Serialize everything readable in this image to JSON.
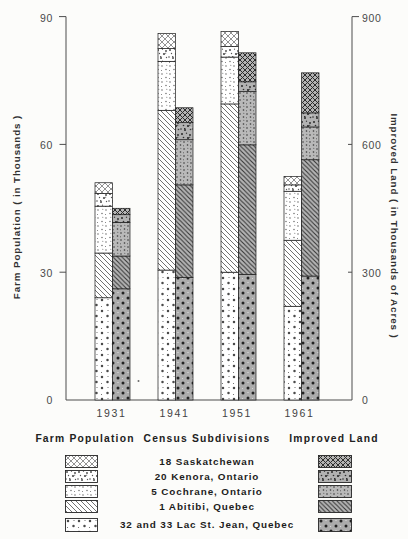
{
  "page": {
    "background": "#fcfcfa"
  },
  "chart_data": {
    "type": "bar",
    "variant": "paired-stacked-columns",
    "title": "",
    "categories": [
      "1931",
      "1941",
      "1951",
      "1961"
    ],
    "left_axis": {
      "label": "Farm Population ( in Thousands )",
      "ticks_top_to_bottom": [
        "90",
        "60",
        "30",
        "0"
      ],
      "min": 0,
      "max": 90
    },
    "right_axis": {
      "label": "Improved Land ( in Thousands of Acres )",
      "ticks_top_to_bottom": [
        "900",
        "600",
        "300",
        "0"
      ],
      "min": 0,
      "max": 900
    },
    "grid": "off",
    "stack_order_bottom_to_top": [
      "lacstjean",
      "abitibi",
      "cochrane",
      "kenora",
      "sask"
    ],
    "series_groups": [
      {
        "name": "Farm Population",
        "axis": "left",
        "units": "thousands of persons",
        "series": [
          {
            "key": "sask",
            "name": "18 Saskatchewan",
            "values": [
              2.5,
              3.5,
              3.5,
              2
            ]
          },
          {
            "key": "kenora",
            "name": "20 Kenora, Ontario",
            "values": [
              3,
              3,
              2.5,
              1.5
            ]
          },
          {
            "key": "cochrane",
            "name": "5 Cochrane, Ontario",
            "values": [
              11,
              11.5,
              11,
              11.5
            ]
          },
          {
            "key": "abitibi",
            "name": "1 Abitibi, Quebec",
            "values": [
              10.5,
              37.5,
              39.5,
              15.5
            ]
          },
          {
            "key": "lacstjean",
            "name": "32 and 33 Lac St. Jean, Quebec",
            "values": [
              24,
              30.5,
              30,
              22
            ]
          }
        ],
        "totals": [
          51,
          86,
          86.5,
          52.5
        ]
      },
      {
        "name": "Improved Land",
        "axis": "right",
        "units": "thousands of acres",
        "series": [
          {
            "key": "sask",
            "name": "18 Saskatchewan",
            "values": [
              15,
              35,
              68,
              94
            ]
          },
          {
            "key": "kenora",
            "name": "20 Kenora, Ontario",
            "values": [
              18,
              40,
              23,
              33
            ]
          },
          {
            "key": "cochrane",
            "name": "5 Cochrane, Ontario",
            "values": [
              79,
              106,
              125,
              77
            ]
          },
          {
            "key": "abitibi",
            "name": "1 Abitibi, Quebec",
            "values": [
              77,
              217,
              304,
              273
            ]
          },
          {
            "key": "lacstjean",
            "name": "32 and 33 Lac St. Jean, Quebec",
            "values": [
              261,
              288,
              295,
              291
            ]
          }
        ],
        "totals": [
          450,
          686,
          815,
          768
        ]
      }
    ]
  },
  "legend": {
    "col_farm": "Farm Population",
    "col_census": "Census Subdivisions",
    "col_improved": "Improved Land",
    "items": [
      {
        "key": "sask",
        "label": "18 Saskatchewan",
        "pattern": "diamond-crosshatch"
      },
      {
        "key": "kenora",
        "label": "20 Kenora, Ontario",
        "pattern": "irregular-speckle"
      },
      {
        "key": "cochrane",
        "label": "5 Cochrane, Ontario",
        "pattern": "fine-dots"
      },
      {
        "key": "abitibi",
        "label": "1 Abitibi, Quebec",
        "pattern": "diagonal-hatch"
      },
      {
        "key": "lacstjean",
        "label": "32 and 33 Lac St. Jean, Quebec",
        "pattern": "coarse-dots"
      }
    ]
  },
  "colors": {
    "light_bar_bg": "#ffffff",
    "dark_bar_bg": "#b5b5b5",
    "ink": "#2b2b2b",
    "axis": "#4d4d4d"
  }
}
